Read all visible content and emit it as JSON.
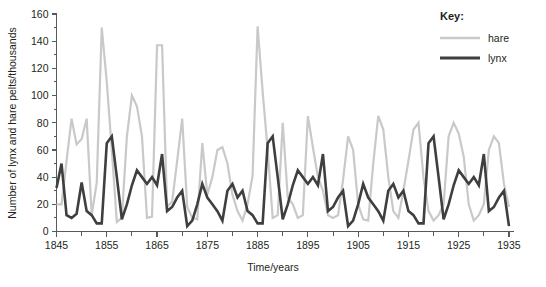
{
  "chart_data": {
    "type": "line",
    "title": "",
    "xlabel": "Time/years",
    "ylabel": "Number of lynx and hare pelts/thousands",
    "xlim": [
      1845,
      1936
    ],
    "ylim": [
      0,
      160
    ],
    "ytick_step": 20,
    "ytick_minor_step": 10,
    "xtick_step": 10,
    "xtick_minor_step": 5,
    "grid": false,
    "legend_position": "top-right",
    "legend_title": "Key:",
    "x_tick_labels": [
      "1845",
      "1855",
      "1865",
      "1875",
      "1885",
      "1895",
      "1905",
      "1915",
      "1925",
      "1935"
    ],
    "y_tick_labels": [
      "0",
      "20",
      "40",
      "60",
      "80",
      "100",
      "120",
      "140",
      "160"
    ],
    "x": [
      1845,
      1846,
      1847,
      1848,
      1849,
      1850,
      1851,
      1852,
      1853,
      1854,
      1855,
      1856,
      1857,
      1858,
      1859,
      1860,
      1861,
      1862,
      1863,
      1864,
      1865,
      1866,
      1867,
      1868,
      1869,
      1870,
      1871,
      1872,
      1873,
      1874,
      1875,
      1876,
      1877,
      1878,
      1879,
      1880,
      1881,
      1882,
      1883,
      1884,
      1885,
      1886,
      1887,
      1888,
      1889,
      1890,
      1891,
      1892,
      1893,
      1894,
      1895,
      1896,
      1897,
      1898,
      1899,
      1900,
      1901,
      1902,
      1903,
      1904,
      1905,
      1906,
      1907,
      1908,
      1909,
      1910,
      1911,
      1912,
      1913,
      1914,
      1915,
      1916,
      1917,
      1918,
      1919,
      1920,
      1921,
      1922,
      1923,
      1924,
      1925,
      1926,
      1927,
      1928,
      1929,
      1930,
      1931,
      1932,
      1933,
      1934,
      1935
    ],
    "series": [
      {
        "name": "hare",
        "color": "#c9c9c9",
        "width": 2.2,
        "values": [
          20,
          20,
          52,
          83,
          64,
          68,
          83,
          12,
          36,
          150,
          110,
          60,
          7,
          10,
          70,
          100,
          92,
          70,
          10,
          11,
          137,
          137,
          18,
          22,
          52,
          83,
          18,
          10,
          9,
          65,
          27,
          40,
          60,
          62,
          50,
          27,
          15,
          8,
          20,
          41,
          151,
          103,
          60,
          10,
          12,
          80,
          25,
          20,
          10,
          12,
          85,
          62,
          40,
          30,
          12,
          10,
          12,
          38,
          70,
          60,
          20,
          9,
          8,
          50,
          85,
          75,
          40,
          15,
          10,
          30,
          52,
          75,
          80,
          40,
          15,
          8,
          12,
          20,
          70,
          80,
          72,
          55,
          20,
          8,
          12,
          20,
          60,
          70,
          65,
          35,
          18
        ]
      },
      {
        "name": "lynx",
        "color": "#3f3f3f",
        "width": 2.6,
        "values": [
          32,
          50,
          12,
          10,
          13,
          36,
          15,
          12,
          6,
          6,
          65,
          70,
          40,
          9,
          20,
          34,
          45,
          40,
          35,
          40,
          34,
          57,
          15,
          18,
          25,
          30,
          4,
          8,
          20,
          35,
          25,
          20,
          15,
          8,
          30,
          35,
          25,
          30,
          15,
          12,
          6,
          6,
          65,
          70,
          40,
          9,
          20,
          34,
          45,
          40,
          35,
          40,
          34,
          57,
          15,
          18,
          25,
          30,
          4,
          8,
          20,
          35,
          25,
          20,
          15,
          8,
          30,
          35,
          25,
          30,
          15,
          12,
          6,
          6,
          65,
          70,
          40,
          9,
          20,
          34,
          45,
          40,
          35,
          40,
          34,
          57,
          15,
          18,
          25,
          30,
          4
        ]
      }
    ]
  },
  "legend": {
    "title": "Key:",
    "entries": [
      {
        "label": "hare",
        "color": "#c9c9c9"
      },
      {
        "label": "lynx",
        "color": "#3f3f3f"
      }
    ]
  },
  "axes": {
    "x_title": "Time/years",
    "y_title": "Number of lynx and hare pelts/thousands"
  }
}
